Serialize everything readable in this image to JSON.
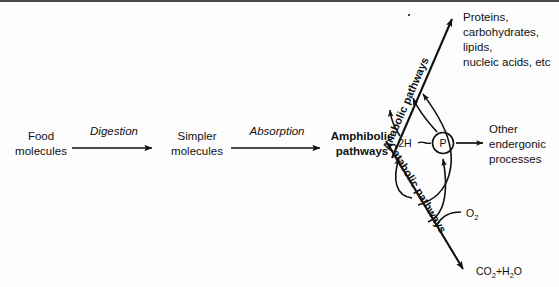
{
  "diagram": {
    "title_visible": false,
    "nodes": {
      "food": {
        "line1": "Food",
        "line2": "molecules"
      },
      "simpler": {
        "line1": "Simpler",
        "line2": "molecules"
      },
      "amphibolic": {
        "line1": "Amphibolic",
        "line2": "pathways"
      },
      "products": {
        "line1": "Proteins,",
        "line2": "carbohydrates,",
        "line3": "lipids,",
        "line4": "nucleic acids, etc"
      },
      "endergonic": {
        "line1": "Other",
        "line2": "endergonic",
        "line3": "processes"
      },
      "waste": {
        "main1": "CO",
        "sub1": "2",
        "plus": "+H",
        "sub2": "2",
        "main2": "O"
      },
      "oxygen": {
        "main": "O",
        "sub": "2"
      },
      "reducing_equivalents": {
        "label": "2H"
      },
      "phosphate": {
        "label": "P"
      }
    },
    "process_labels": {
      "digestion": "Digestion",
      "absorption": "Absorption",
      "anabolic": "Anabolic pathways",
      "catabolic": "Catabolic pathways"
    },
    "colors": {
      "ink": "#111111",
      "background": "#fdfdfd",
      "rule": "#4a4a4a"
    }
  }
}
